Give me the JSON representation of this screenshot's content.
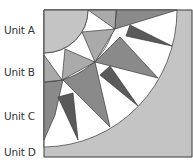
{
  "labels": [
    {
      "text": "Unit A",
      "y": 24
    },
    {
      "text": "Unit B",
      "y": 66
    },
    {
      "text": "Unit C",
      "y": 110
    },
    {
      "text": "Unit D",
      "y": 146
    }
  ],
  "colors": {
    "light": "#c4c4c4",
    "mid": "#aaaaaa",
    "medium_dark": "#8a8a8a",
    "dark": "#5a5a5a",
    "white": "#ffffff",
    "stroke": "#3a3a3a"
  }
}
